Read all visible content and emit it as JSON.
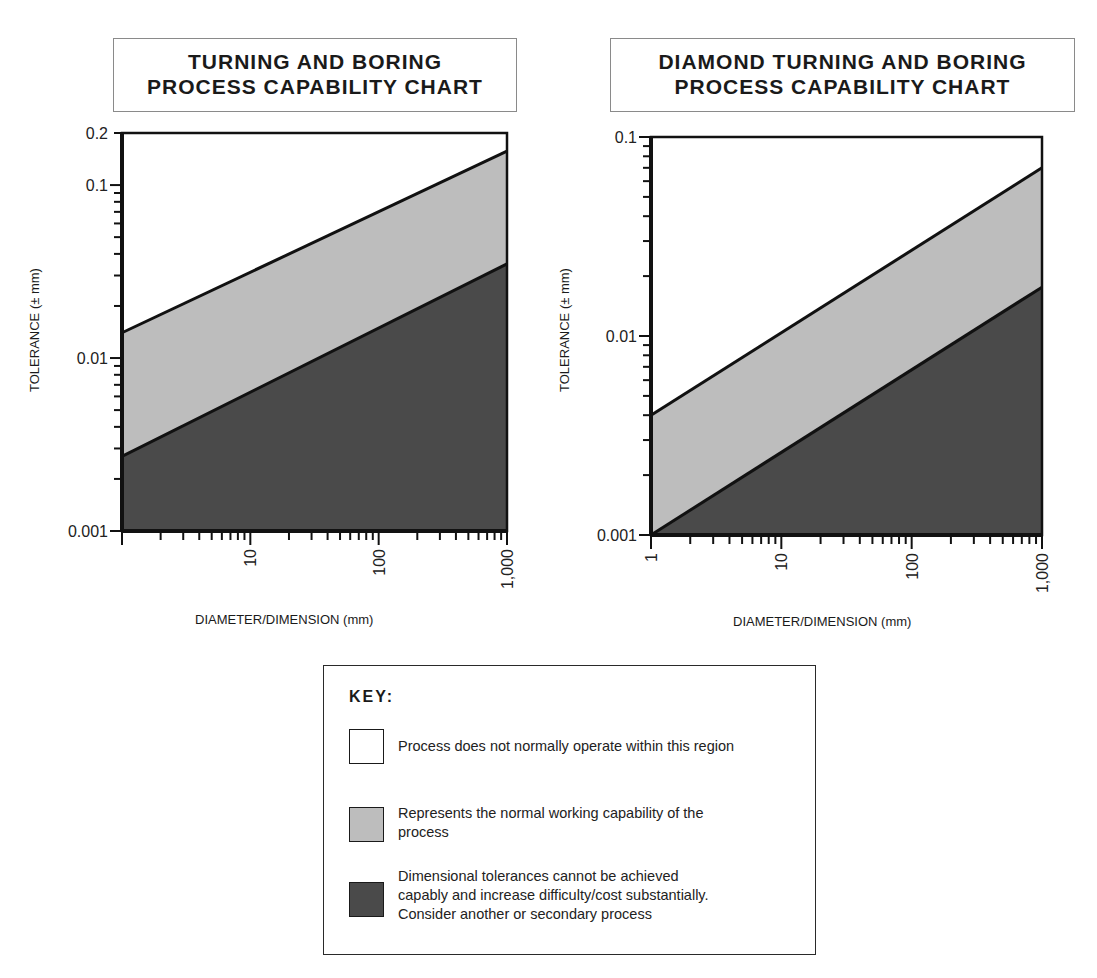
{
  "charts": [
    {
      "title_line1": "TURNING AND BORING",
      "title_line2": "PROCESS CAPABILITY CHART",
      "ylabel": "TOLERANCE (± mm)",
      "xlabel": "DIAMETER/DIMENSION (mm)",
      "ytick_labels": [
        "0.2",
        "0.1",
        "0.01",
        "0.001"
      ],
      "xtick_labels": [
        "10",
        "100",
        "1,000"
      ]
    },
    {
      "title_line1": "DIAMOND TURNING AND BORING",
      "title_line2": "PROCESS CAPABILITY CHART",
      "ylabel": "TOLERANCE (± mm)",
      "xlabel": "DIAMETER/DIMENSION (mm)",
      "ytick_labels": [
        "0.1",
        "0.01",
        "0.001"
      ],
      "xtick_labels": [
        "1",
        "10",
        "100",
        "1,000"
      ]
    }
  ],
  "key": {
    "title": "KEY:",
    "items": [
      {
        "swatch": "#ffffff",
        "text": "Process does not normally operate within this region"
      },
      {
        "swatch": "#bdbdbd",
        "text_line1": "Represents the normal working capability of the",
        "text_line2": "process"
      },
      {
        "swatch": "#4a4a4a",
        "text_line1": "Dimensional tolerances cannot be achieved",
        "text_line2": "capably and increase difficulty/cost substantially.",
        "text_line3": "Consider another or secondary process"
      }
    ]
  },
  "colors": {
    "not_operate": "#ffffff",
    "normal_capability": "#bdbdbd",
    "not_achievable": "#4a4a4a",
    "lines": "#111111"
  },
  "chart_data": [
    {
      "type": "area",
      "title": "TURNING AND BORING PROCESS CAPABILITY CHART",
      "xlabel": "DIAMETER/DIMENSION (mm)",
      "ylabel": "TOLERANCE (± mm)",
      "xscale": "log",
      "yscale": "log",
      "xlim": [
        1,
        1000
      ],
      "ylim": [
        0.001,
        0.2
      ],
      "xticks": [
        10,
        100,
        1000
      ],
      "yticks": [
        0.001,
        0.01,
        0.1,
        0.2
      ],
      "grid": false,
      "series": [
        {
          "name": "Upper capability boundary",
          "x": [
            1,
            1000
          ],
          "y": [
            0.014,
            0.157
          ]
        },
        {
          "name": "Lower capability boundary",
          "x": [
            1,
            1000
          ],
          "y": [
            0.0027,
            0.035
          ]
        }
      ],
      "regions": [
        {
          "name": "Process does not normally operate within this region",
          "position": "above upper boundary",
          "color": "#ffffff"
        },
        {
          "name": "Normal working capability",
          "position": "between boundaries",
          "color": "#bdbdbd"
        },
        {
          "name": "Tolerances cannot be achieved capably",
          "position": "below lower boundary",
          "color": "#4a4a4a"
        }
      ]
    },
    {
      "type": "area",
      "title": "DIAMOND TURNING AND BORING PROCESS CAPABILITY CHART",
      "xlabel": "DIAMETER/DIMENSION (mm)",
      "ylabel": "TOLERANCE (± mm)",
      "xscale": "log",
      "yscale": "log",
      "xlim": [
        1,
        1000
      ],
      "ylim": [
        0.001,
        0.1
      ],
      "xticks": [
        1,
        10,
        100,
        1000
      ],
      "yticks": [
        0.001,
        0.01,
        0.1
      ],
      "grid": false,
      "series": [
        {
          "name": "Upper capability boundary",
          "x": [
            1,
            1000
          ],
          "y": [
            0.004,
            0.07
          ]
        },
        {
          "name": "Lower capability boundary",
          "x": [
            1,
            1000
          ],
          "y": [
            0.001,
            0.0176
          ]
        }
      ],
      "regions": [
        {
          "name": "Process does not normally operate within this region",
          "position": "above upper boundary",
          "color": "#ffffff"
        },
        {
          "name": "Normal working capability",
          "position": "between boundaries",
          "color": "#bdbdbd"
        },
        {
          "name": "Tolerances cannot be achieved capably",
          "position": "below lower boundary",
          "color": "#4a4a4a"
        }
      ]
    }
  ]
}
